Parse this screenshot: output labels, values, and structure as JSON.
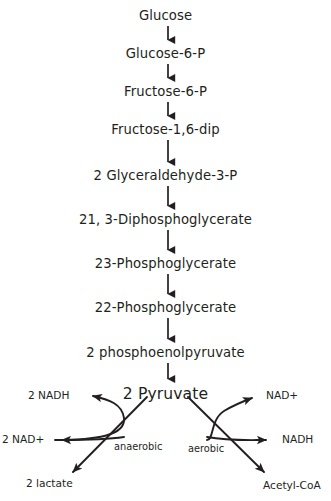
{
  "diagram": {
    "type": "flowchart",
    "background_color": "#ffffff",
    "stroke_color": "#231f20",
    "chain": [
      {
        "id": "glucose",
        "label": "Glucose",
        "y": 8
      },
      {
        "id": "glucose-6-p",
        "label": "Glucose-6-P",
        "y": 46
      },
      {
        "id": "fructose-6-p",
        "label": "Fructose-6-P",
        "y": 84
      },
      {
        "id": "fructose-1-6-dip",
        "label": "Fructose-1,6-dip",
        "y": 122
      },
      {
        "id": "glyceraldehyde-3-p",
        "label": "2 Glyceraldehyde-3-P",
        "y": 168
      },
      {
        "id": "diphosphoglycerate",
        "label": "21, 3-Diphosphoglycerate",
        "y": 212
      },
      {
        "id": "3-phosphoglycerate",
        "label": "23-Phosphoglycerate",
        "y": 256
      },
      {
        "id": "2-phosphoglycerate",
        "label": "22-Phosphoglycerate",
        "y": 300
      },
      {
        "id": "phosphoenolpyruvate",
        "label": "2 phosphoenolpyruvate",
        "y": 345
      },
      {
        "id": "pyruvate",
        "label": "2 Pyruvate",
        "y": 386
      }
    ],
    "branches": {
      "anaerobic": {
        "condition_label": "anaerobic",
        "product_label": "2 lactate",
        "cofactor_in_label": "2 NAD+",
        "cofactor_out_label": "2 NADH"
      },
      "aerobic": {
        "condition_label": "aerobic",
        "product_label": "Acetyl-CoA",
        "cofactor_in_label": "NAD+",
        "cofactor_out_label": "NADH"
      }
    }
  }
}
